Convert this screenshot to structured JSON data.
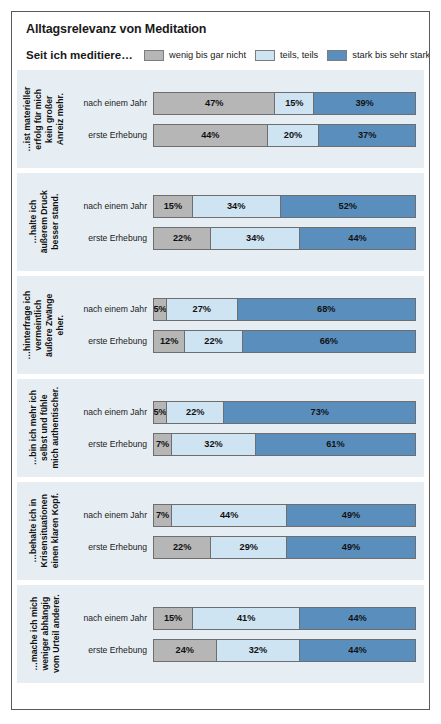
{
  "header": {
    "title": "Alltagsrelevanz von Meditation",
    "subtitle": "Seit ich meditiere…"
  },
  "legend": [
    {
      "label": "wenig bis gar nicht",
      "color": "#b6b6b6",
      "key": "low"
    },
    {
      "label": "teils, teils",
      "color": "#cfe4f3",
      "key": "mid"
    },
    {
      "label": "stark bis sehr stark",
      "color": "#5a8fbd",
      "key": "high"
    }
  ],
  "row_labels": {
    "after_year": "nach einem Jahr",
    "first_survey": "erste Erhebung"
  },
  "chart_data": {
    "type": "bar",
    "title": "Alltagsrelevanz von Meditation",
    "subtitle": "Seit ich meditiere…",
    "orientation": "horizontal",
    "stacked": true,
    "normalized": true,
    "unit": "%",
    "xlabel": "",
    "ylabel": "",
    "xlim": [
      0,
      100
    ],
    "grid": false,
    "legend_position": "top-right",
    "categories": [
      "…ist materieller erfolg für mich kein großer Anreiz mehr.",
      "…halte ich äußerem Druck besser stand.",
      "…hinterfrage ich vermeintlich äußere Zwänge eher.",
      "…bin ich mehr ich selbst und fühle mich authentischer.",
      "…behalte ich in Krisensituationen einen klaren Kopf.",
      "…mache ich mich weniger abhängig vom Urteil anderer."
    ],
    "groups": [
      {
        "category": "…ist materieller erfolg für mich kein großer Anreiz mehr.",
        "category_lines": [
          "…ist materieller",
          "erfolg für mich",
          "kein großer",
          "Anreiz mehr."
        ],
        "bars": [
          {
            "label": "nach einem Jahr",
            "low": 47,
            "mid": 15,
            "high": 39,
            "low_text": "47%",
            "mid_text": "15%",
            "high_text": "39%"
          },
          {
            "label": "erste Erhebung",
            "low": 44,
            "mid": 20,
            "high": 37,
            "low_text": "44%",
            "mid_text": "20%",
            "high_text": "37%"
          }
        ]
      },
      {
        "category": "…halte ich äußerem Druck besser stand.",
        "category_lines": [
          "…halte ich",
          "äußerem Druck",
          "besser stand."
        ],
        "bars": [
          {
            "label": "nach einem Jahr",
            "low": 15,
            "mid": 34,
            "high": 52,
            "low_text": "15%",
            "mid_text": "34%",
            "high_text": "52%"
          },
          {
            "label": "erste Erhebung",
            "low": 22,
            "mid": 34,
            "high": 44,
            "low_text": "22%",
            "mid_text": "34%",
            "high_text": "44%"
          }
        ]
      },
      {
        "category": "…hinterfrage ich vermeintlich äußere Zwänge eher.",
        "category_lines": [
          "…hinterfrage ich",
          "vermeintlich",
          "äußere Zwänge",
          "eher."
        ],
        "bars": [
          {
            "label": "nach einem Jahr",
            "low": 5,
            "mid": 27,
            "high": 68,
            "low_text": "5%",
            "mid_text": "27%",
            "high_text": "68%"
          },
          {
            "label": "erste Erhebung",
            "low": 12,
            "mid": 22,
            "high": 66,
            "low_text": "12%",
            "mid_text": "22%",
            "high_text": "66%"
          }
        ]
      },
      {
        "category": "…bin ich mehr ich selbst und fühle mich authentischer.",
        "category_lines": [
          "…bin ich mehr ich",
          "selbst und fühle",
          "mich authentischer."
        ],
        "bars": [
          {
            "label": "nach einem Jahr",
            "low": 5,
            "mid": 22,
            "high": 73,
            "low_text": "5%",
            "mid_text": "22%",
            "high_text": "73%"
          },
          {
            "label": "erste Erhebung",
            "low": 7,
            "mid": 32,
            "high": 61,
            "low_text": "7%",
            "mid_text": "32%",
            "high_text": "61%"
          }
        ]
      },
      {
        "category": "…behalte ich in Krisensituationen einen klaren Kopf.",
        "category_lines": [
          "…behalte ich in",
          "Krisensituationen",
          "einen klaren Kopf."
        ],
        "bars": [
          {
            "label": "nach einem Jahr",
            "low": 7,
            "mid": 44,
            "high": 49,
            "low_text": "7%",
            "mid_text": "44%",
            "high_text": "49%"
          },
          {
            "label": "erste Erhebung",
            "low": 22,
            "mid": 29,
            "high": 49,
            "low_text": "22%",
            "mid_text": "29%",
            "high_text": "49%"
          }
        ]
      },
      {
        "category": "…mache ich mich weniger abhängig vom Urteil anderer.",
        "category_lines": [
          "…mache ich mich",
          "weniger abhängig",
          "vom Urteil anderer."
        ],
        "bars": [
          {
            "label": "nach einem Jahr",
            "low": 15,
            "mid": 41,
            "high": 44,
            "low_text": "15%",
            "mid_text": "41%",
            "high_text": "44%"
          },
          {
            "label": "erste Erhebung",
            "low": 24,
            "mid": 32,
            "high": 44,
            "low_text": "24%",
            "mid_text": "32%",
            "high_text": "44%"
          }
        ]
      }
    ]
  }
}
